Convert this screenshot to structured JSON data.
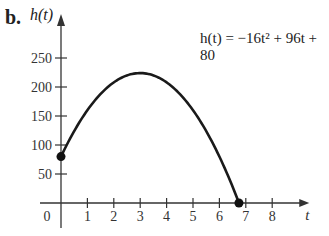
{
  "part_label": "b.",
  "equation": {
    "lhs": "h(t)",
    "text": "h(t) = −16t² + 96t + 80"
  },
  "axes": {
    "x_label": "t",
    "y_label": "h(t)",
    "x_ticks": [
      "0",
      "1",
      "2",
      "3",
      "4",
      "5",
      "6",
      "7",
      "8"
    ],
    "y_ticks": [
      "50",
      "100",
      "150",
      "200",
      "250"
    ]
  },
  "chart_data": {
    "type": "line",
    "title": "",
    "equation": "h(t) = -16t^2 + 96t + 80",
    "xlabel": "t",
    "ylabel": "h(t)",
    "xlim": [
      0,
      8.5
    ],
    "ylim": [
      0,
      270
    ],
    "x_ticks": [
      0,
      1,
      2,
      3,
      4,
      5,
      6,
      7,
      8
    ],
    "y_ticks": [
      50,
      100,
      150,
      200,
      250
    ],
    "grid": false,
    "series": [
      {
        "name": "h(t)",
        "x": [
          0,
          0.5,
          1,
          1.5,
          2,
          2.5,
          3,
          3.5,
          4,
          4.5,
          5,
          5.5,
          6,
          6.5,
          6.74
        ],
        "values": [
          80,
          124,
          160,
          188,
          208,
          220,
          224,
          220,
          208,
          188,
          160,
          124,
          80,
          28,
          0
        ]
      }
    ],
    "points": [
      {
        "x": 0,
        "y": 80,
        "marker": "filled-circle"
      },
      {
        "x": 6.74,
        "y": 0,
        "marker": "filled-circle"
      }
    ],
    "vertex": {
      "x": 3,
      "y": 224
    }
  }
}
